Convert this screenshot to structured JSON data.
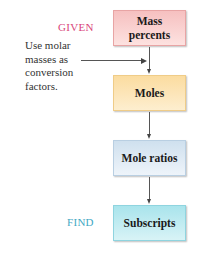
{
  "diagram": {
    "type": "flowchart",
    "labels": {
      "given": "GIVEN",
      "find": "FIND"
    },
    "note": "Use molar masses as conversion factors.",
    "steps": [
      {
        "label": "Mass percents",
        "color": "#f6c9c7"
      },
      {
        "label": "Moles",
        "color": "#fce5b6"
      },
      {
        "label": "Mole ratios",
        "color": "#deeaf5"
      },
      {
        "label": "Subscripts",
        "color": "#bfeaf0"
      }
    ],
    "colors": {
      "given": "#d9467a",
      "find": "#3fa8c4",
      "arrow": "#444444"
    }
  }
}
